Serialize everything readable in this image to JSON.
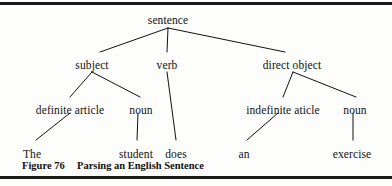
{
  "figure": {
    "caption_number": "Figure 76",
    "caption_title": "Parsing an English Sentence",
    "ink_color": "#111111",
    "rule_color": "#1a1a1a",
    "background_color": "#fdfdfb"
  },
  "tree": {
    "nodes": {
      "sentence": {
        "label": "sentence",
        "x": 168,
        "y": 14
      },
      "subject": {
        "label": "subject",
        "x": 92,
        "y": 59
      },
      "verb": {
        "label": "verb",
        "x": 167,
        "y": 59
      },
      "direct_object": {
        "label": "direct object",
        "x": 292,
        "y": 59
      },
      "definite_article": {
        "label": "definite article",
        "x": 70,
        "y": 104
      },
      "noun_subject": {
        "label": "noun",
        "x": 141,
        "y": 104
      },
      "indefinite_article": {
        "label": "indefinite aticle",
        "x": 283,
        "y": 104
      },
      "noun_object": {
        "label": "noun",
        "x": 355,
        "y": 104
      },
      "leaf_the": {
        "label": "The",
        "x": 32,
        "y": 148
      },
      "leaf_student": {
        "label": "student",
        "x": 136,
        "y": 148
      },
      "leaf_does": {
        "label": "does",
        "x": 176,
        "y": 148
      },
      "leaf_an": {
        "label": "an",
        "x": 244,
        "y": 148
      },
      "leaf_exercise": {
        "label": "exercise",
        "x": 352,
        "y": 148
      }
    },
    "edges": [
      {
        "from": "sentence",
        "to": "subject",
        "x1": 168,
        "y1": 28,
        "x2": 100,
        "y2": 52
      },
      {
        "from": "sentence",
        "to": "verb",
        "x1": 168,
        "y1": 28,
        "x2": 167,
        "y2": 52
      },
      {
        "from": "sentence",
        "to": "direct_object",
        "x1": 168,
        "y1": 28,
        "x2": 285,
        "y2": 52
      },
      {
        "from": "subject",
        "to": "definite_article",
        "x1": 92,
        "y1": 72,
        "x2": 70,
        "y2": 97
      },
      {
        "from": "subject",
        "to": "noun_subject",
        "x1": 92,
        "y1": 72,
        "x2": 140,
        "y2": 97
      },
      {
        "from": "direct_object",
        "to": "indefinite_article",
        "x1": 293,
        "y1": 72,
        "x2": 283,
        "y2": 97
      },
      {
        "from": "direct_object",
        "to": "noun_object",
        "x1": 293,
        "y1": 72,
        "x2": 356,
        "y2": 97
      },
      {
        "from": "definite_article",
        "to": "leaf_the",
        "x1": 70,
        "y1": 113,
        "x2": 36,
        "y2": 140
      },
      {
        "from": "noun_subject",
        "to": "leaf_student",
        "x1": 138,
        "y1": 113,
        "x2": 137,
        "y2": 140
      },
      {
        "from": "verb",
        "to": "leaf_does",
        "x1": 167,
        "y1": 72,
        "x2": 176,
        "y2": 140
      },
      {
        "from": "indefinite_article",
        "to": "leaf_an",
        "x1": 278,
        "y1": 113,
        "x2": 247,
        "y2": 140
      },
      {
        "from": "noun_object",
        "to": "leaf_exercise",
        "x1": 353,
        "y1": 113,
        "x2": 353,
        "y2": 140
      }
    ]
  }
}
